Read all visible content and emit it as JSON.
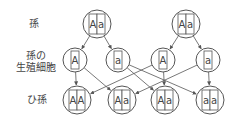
{
  "labels": {
    "parent": "孫",
    "gamete_line1": "孫の",
    "gamete_line2": "生殖細胞",
    "offspring": "ひ孫"
  },
  "parents": [
    {
      "id": "p1",
      "cx": 97,
      "cy": 24,
      "alleles": [
        "A",
        "a"
      ]
    },
    {
      "id": "p2",
      "cx": 186,
      "cy": 24,
      "alleles": [
        "A",
        "a"
      ]
    }
  ],
  "gametes": [
    {
      "id": "g1",
      "cx": 75,
      "cy": 60,
      "allele": "A"
    },
    {
      "id": "g2",
      "cx": 118,
      "cy": 60,
      "allele": "a"
    },
    {
      "id": "g3",
      "cx": 163,
      "cy": 60,
      "allele": "A"
    },
    {
      "id": "g4",
      "cx": 208,
      "cy": 60,
      "allele": "a"
    }
  ],
  "offspring": [
    {
      "id": "o1",
      "cx": 77,
      "cy": 100,
      "alleles": [
        "A",
        "A"
      ]
    },
    {
      "id": "o2",
      "cx": 122,
      "cy": 100,
      "alleles": [
        "A",
        "a"
      ]
    },
    {
      "id": "o3",
      "cx": 165,
      "cy": 100,
      "alleles": [
        "A",
        "a"
      ]
    },
    {
      "id": "o4",
      "cx": 210,
      "cy": 100,
      "alleles": [
        "a",
        "a"
      ]
    }
  ],
  "edges": [
    [
      "p1",
      "g1"
    ],
    [
      "p1",
      "g2"
    ],
    [
      "p2",
      "g3"
    ],
    [
      "p2",
      "g4"
    ],
    [
      "g1",
      "o1"
    ],
    [
      "g1",
      "o2"
    ],
    [
      "g2",
      "o3"
    ],
    [
      "g2",
      "o4"
    ],
    [
      "g3",
      "o3"
    ],
    [
      "g3",
      "o1"
    ],
    [
      "g4",
      "o4"
    ],
    [
      "g4",
      "o2"
    ]
  ],
  "colors": {
    "stroke": "#555555",
    "text": "#444444"
  }
}
